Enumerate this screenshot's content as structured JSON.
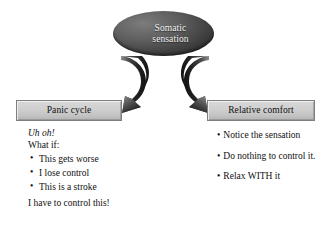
{
  "diagram": {
    "title_node": {
      "label": "Somatic\nsensation",
      "fill_color": "#3a3a3a",
      "text_color": "#f2f2f2"
    },
    "arrows": [
      {
        "name": "arrow-to-panic-cycle",
        "direction": "down-left"
      },
      {
        "name": "arrow-to-relative-comfort",
        "direction": "down-right"
      }
    ],
    "left_branch": {
      "box_label": "Panic cycle",
      "lines": [
        {
          "text": "Uh oh!",
          "style": "italic"
        },
        {
          "text": "What if:",
          "style": "normal"
        }
      ],
      "bullets": [
        "This gets worse",
        "I lose control",
        "This is a stroke"
      ],
      "closing_line": "I have to control this!"
    },
    "right_branch": {
      "box_label": "Relative comfort",
      "bullets": [
        "Notice the sensation",
        "Do nothing to control it.",
        "Relax WITH it"
      ]
    },
    "colors": {
      "box_fill": "#cfcfcf",
      "box_border": "#7e7e7e",
      "arrow_dark": "#262626",
      "arrow_light": "#9a9a9a",
      "background": "#ffffff"
    }
  }
}
